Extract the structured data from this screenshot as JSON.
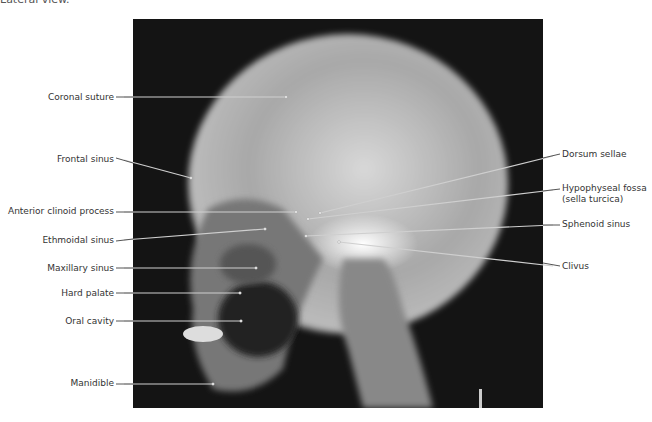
{
  "caption": "Lateral view.",
  "figure": {
    "type": "radiograph",
    "left_labels": [
      {
        "text": "Coronal suture",
        "y": 97,
        "end": [
          286,
          97
        ]
      },
      {
        "text": "Frontal sinus",
        "y": 160,
        "end": [
          191,
          178
        ]
      },
      {
        "text": "Anterior clinoid process",
        "y": 212,
        "end": [
          296,
          212
        ]
      },
      {
        "text": "Ethmoidal sinus",
        "y": 240,
        "end": [
          265,
          229
        ]
      },
      {
        "text": "Maxillary sinus",
        "y": 268,
        "end": [
          256,
          268
        ]
      },
      {
        "text": "Hard palate",
        "y": 293,
        "end": [
          240,
          293
        ]
      },
      {
        "text": "Oral cavity",
        "y": 321,
        "end": [
          241,
          321
        ]
      },
      {
        "text": "Manidible",
        "y": 384,
        "end": [
          213,
          384
        ]
      }
    ],
    "right_labels": [
      {
        "text": "Dorsum sellae",
        "y": 156,
        "end": [
          320,
          213
        ]
      },
      {
        "text": "Hypophyseal fossa",
        "text2": "(sella turcica)",
        "y": 190,
        "end": [
          308,
          219
        ]
      },
      {
        "text": "Sphenoid sinus",
        "y": 225,
        "end": [
          306,
          236
        ]
      },
      {
        "text": "Clivus",
        "y": 266,
        "end": [
          339,
          242
        ]
      }
    ]
  }
}
